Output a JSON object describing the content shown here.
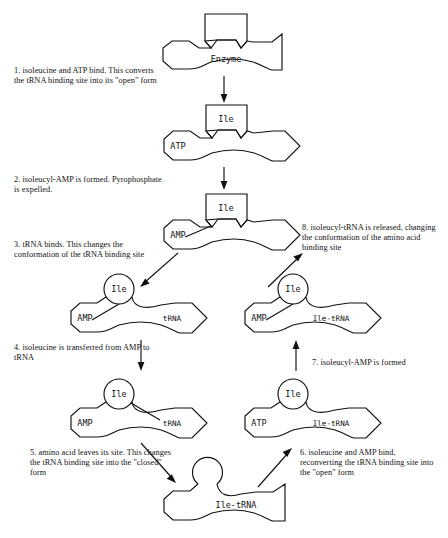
{
  "figure": {
    "type": "cyclic-process-diagram"
  },
  "steps": [
    {
      "id": 1,
      "text": "1.  isoleucine and ATP bind. This converts the tRNA binding site into its \"open\" form"
    },
    {
      "id": 2,
      "text": "2.  isoleucyl-AMP is formed. Pyrophosphate is expelled."
    },
    {
      "id": 3,
      "text": "3.  tRNA binds. This changes the conformation of the tRNA binding site"
    },
    {
      "id": 4,
      "text": "4.  isoleucine is transferred from AMP to tRNA"
    },
    {
      "id": 5,
      "text": "5.  amino acid leaves its site. This changes the tRNA binding site into the \"closed\" form"
    },
    {
      "id": 6,
      "text": "6.  isoleucine and AMP bind, reconverting the tRNA binding site into the \"open\" form"
    },
    {
      "id": 7,
      "text": "7.  isoleucyl-AMP is formed"
    },
    {
      "id": 8,
      "text": "8.  isoleucyl-tRNA is released, changing the conformation of the amino acid binding site"
    }
  ],
  "states": [
    {
      "id": "state-enzyme",
      "enzyme_label": "Enzyme",
      "amino_acid_site": "empty-square-notch",
      "left_site": "hexagon",
      "right_site": "triangle-closed",
      "bound": []
    },
    {
      "id": "state-ile-atp",
      "enzyme_label": "",
      "amino_acid_site": "square",
      "left_site": "hexagon",
      "right_site": "kite-open",
      "bound": [
        "Ile",
        "ATP"
      ]
    },
    {
      "id": "state-ile-amp",
      "enzyme_label": "",
      "amino_acid_site": "square",
      "left_site": "hexagon",
      "right_site": "kite-open",
      "bound": [
        "Ile",
        "AMP"
      ],
      "bond": "Ile-AMP"
    },
    {
      "id": "state-ile-amp-trna",
      "enzyme_label": "",
      "amino_acid_site": "circle",
      "left_site": "hexagon",
      "right_site": "diamond",
      "bound": [
        "Ile",
        "AMP",
        "tRNA"
      ],
      "bond": "Ile-AMP"
    },
    {
      "id": "state-ile-trna-bonded",
      "enzyme_label": "",
      "amino_acid_site": "circle",
      "left_site": "hexagon",
      "right_site": "diamond",
      "bound": [
        "Ile",
        "AMP",
        "tRNA"
      ],
      "bond": "Ile-tRNA"
    },
    {
      "id": "state-ile-trna-released",
      "enzyme_label": "",
      "amino_acid_site": "circle-empty",
      "left_site": "hexagon",
      "right_site": "triangle-closed",
      "bound": [
        "Ile-tRNA"
      ]
    },
    {
      "id": "state-atp-ile-trna",
      "enzyme_label": "",
      "amino_acid_site": "circle",
      "left_site": "hexagon",
      "right_site": "diamond",
      "bound": [
        "Ile",
        "ATP",
        "Ile-tRNA"
      ]
    },
    {
      "id": "state-amp-ile-trna",
      "enzyme_label": "",
      "amino_acid_site": "circle",
      "left_site": "hexagon",
      "right_site": "diamond",
      "bound": [
        "Ile",
        "AMP",
        "Ile-tRNA"
      ],
      "bond": "Ile-AMP"
    }
  ],
  "molecules": {
    "enzyme": "Enzyme",
    "ile": "Ile",
    "atp": "ATP",
    "amp": "AMP",
    "trna": "tRNA",
    "ile_trna": "Ile-tRNA"
  },
  "colors": {
    "ink": "#111111",
    "background": "#ffffff"
  }
}
